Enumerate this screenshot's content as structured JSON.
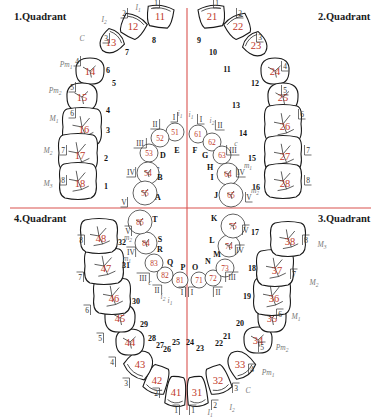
{
  "colors": {
    "axis": "#d9534f",
    "fdi_number": "#c0392b",
    "outline": "#1a1a1a",
    "type_label": "#777777"
  },
  "quadrants": [
    {
      "label": "1.Quadrant",
      "position": "top-left"
    },
    {
      "label": "2.Quadrant",
      "position": "top-right"
    },
    {
      "label": "3.Quadrant",
      "position": "bottom-right"
    },
    {
      "label": "4.Quadrant",
      "position": "bottom-left"
    }
  ],
  "permanent_teeth": [
    {
      "fdi": "11",
      "universal": "8",
      "zsig": "1",
      "type": "I1",
      "kind": "incisor"
    },
    {
      "fdi": "12",
      "universal": "7",
      "zsig": "2",
      "type": "I2",
      "kind": "incisor"
    },
    {
      "fdi": "13",
      "universal": "6",
      "zsig": "3",
      "type": "C",
      "kind": "canine"
    },
    {
      "fdi": "14",
      "universal": "5",
      "zsig": "4",
      "type": "Pm1",
      "kind": "premolar"
    },
    {
      "fdi": "15",
      "universal": "4",
      "zsig": "5",
      "type": "Pm2",
      "kind": "premolar"
    },
    {
      "fdi": "16",
      "universal": "3",
      "zsig": "6",
      "type": "M1",
      "kind": "molar"
    },
    {
      "fdi": "17",
      "universal": "2",
      "zsig": "7",
      "type": "M2",
      "kind": "molar"
    },
    {
      "fdi": "18",
      "universal": "1",
      "zsig": "8",
      "type": "M3",
      "kind": "molar"
    },
    {
      "fdi": "21",
      "universal": "9",
      "zsig": "1",
      "type": "",
      "kind": "incisor"
    },
    {
      "fdi": "22",
      "universal": "10",
      "zsig": "2",
      "type": "",
      "kind": "incisor"
    },
    {
      "fdi": "23",
      "universal": "11",
      "zsig": "3",
      "type": "",
      "kind": "canine"
    },
    {
      "fdi": "24",
      "universal": "12",
      "zsig": "4",
      "type": "",
      "kind": "premolar"
    },
    {
      "fdi": "25",
      "universal": "13",
      "zsig": "5",
      "type": "",
      "kind": "premolar"
    },
    {
      "fdi": "26",
      "universal": "14",
      "zsig": "6",
      "type": "",
      "kind": "molar"
    },
    {
      "fdi": "27",
      "universal": "15",
      "zsig": "7",
      "type": "",
      "kind": "molar"
    },
    {
      "fdi": "28",
      "universal": "16",
      "zsig": "8",
      "type": "",
      "kind": "molar"
    },
    {
      "fdi": "31",
      "universal": "24",
      "zsig": "1",
      "type": "I1",
      "kind": "incisor"
    },
    {
      "fdi": "32",
      "universal": "23",
      "zsig": "2",
      "type": "I2",
      "kind": "incisor"
    },
    {
      "fdi": "33",
      "universal": "22",
      "zsig": "3",
      "type": "C",
      "kind": "canine"
    },
    {
      "fdi": "34",
      "universal": "21",
      "zsig": "4",
      "type": "Pm1",
      "kind": "premolar"
    },
    {
      "fdi": "35",
      "universal": "20",
      "zsig": "5",
      "type": "Pm2",
      "kind": "premolar"
    },
    {
      "fdi": "36",
      "universal": "19",
      "zsig": "6",
      "type": "M1",
      "kind": "molar"
    },
    {
      "fdi": "37",
      "universal": "18",
      "zsig": "7",
      "type": "M2",
      "kind": "molar"
    },
    {
      "fdi": "38",
      "universal": "17",
      "zsig": "8",
      "type": "M3",
      "kind": "molar"
    },
    {
      "fdi": "41",
      "universal": "25",
      "zsig": "1",
      "type": "",
      "kind": "incisor"
    },
    {
      "fdi": "42",
      "universal": "26",
      "zsig": "2",
      "type": "",
      "kind": "incisor"
    },
    {
      "fdi": "43",
      "universal": "27",
      "zsig": "3",
      "type": "",
      "kind": "canine"
    },
    {
      "fdi": "44",
      "universal": "28",
      "zsig": "4",
      "type": "",
      "kind": "premolar"
    },
    {
      "fdi": "45",
      "universal": "29",
      "zsig": "5",
      "type": "",
      "kind": "premolar"
    },
    {
      "fdi": "46",
      "universal": "30",
      "zsig": "6",
      "type": "",
      "kind": "molar"
    },
    {
      "fdi": "47",
      "universal": "31",
      "zsig": "7",
      "type": "",
      "kind": "molar"
    },
    {
      "fdi": "48",
      "universal": "32",
      "zsig": "8",
      "type": "",
      "kind": "molar"
    }
  ],
  "primary_teeth": [
    {
      "fdi": "51",
      "universal": "E",
      "zsig": "I",
      "type": "i1"
    },
    {
      "fdi": "52",
      "universal": "D",
      "zsig": "II",
      "type": ""
    },
    {
      "fdi": "53",
      "universal": "C",
      "zsig": "III",
      "type": ""
    },
    {
      "fdi": "54",
      "universal": "B",
      "zsig": "IV",
      "type": ""
    },
    {
      "fdi": "55",
      "universal": "A",
      "zsig": "V",
      "type": ""
    },
    {
      "fdi": "61",
      "universal": "F",
      "zsig": "I",
      "type": "i1"
    },
    {
      "fdi": "62",
      "universal": "G",
      "zsig": "II",
      "type": "i2"
    },
    {
      "fdi": "63",
      "universal": "H",
      "zsig": "III",
      "type": "c"
    },
    {
      "fdi": "64",
      "universal": "I",
      "zsig": "IV",
      "type": "m1"
    },
    {
      "fdi": "65",
      "universal": "J",
      "zsig": "V",
      "type": "m2"
    },
    {
      "fdi": "71",
      "universal": "O",
      "zsig": "I",
      "type": ""
    },
    {
      "fdi": "72",
      "universal": "N",
      "zsig": "II",
      "type": ""
    },
    {
      "fdi": "73",
      "universal": "M",
      "zsig": "III",
      "type": ""
    },
    {
      "fdi": "74",
      "universal": "L",
      "zsig": "IV",
      "type": ""
    },
    {
      "fdi": "75",
      "universal": "K",
      "zsig": "V",
      "type": ""
    },
    {
      "fdi": "81",
      "universal": "P",
      "zsig": "I",
      "type": "i1"
    },
    {
      "fdi": "82",
      "universal": "Q",
      "zsig": "II",
      "type": "i2"
    },
    {
      "fdi": "83",
      "universal": "R",
      "zsig": "III",
      "type": "c"
    },
    {
      "fdi": "84",
      "universal": "S",
      "zsig": "IV",
      "type": "m1"
    },
    {
      "fdi": "85",
      "universal": "T",
      "zsig": "V",
      "type": "m2"
    }
  ]
}
